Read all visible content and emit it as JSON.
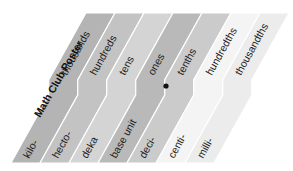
{
  "title": "Math Club Poster",
  "decimal_point_color": "#111111",
  "bands": [
    {
      "upper": "thousands",
      "lower": "kilo-",
      "color": "#b4b4b4"
    },
    {
      "upper": "hundreds",
      "lower": "hecto-",
      "color": "#c3c3c3"
    },
    {
      "upper": "tens",
      "lower": "deka",
      "color": "#d4d4d4"
    },
    {
      "upper": "ones",
      "lower": "base unit",
      "color": "#b9b9b9"
    },
    {
      "upper": "tenths",
      "lower": "deci-",
      "color": "#cbcbcb"
    },
    {
      "upper": "hundredths",
      "lower": "centi-",
      "color": "#f4f4f4"
    },
    {
      "upper": "thousandths",
      "lower": "milli-",
      "color": "#ececec"
    }
  ]
}
